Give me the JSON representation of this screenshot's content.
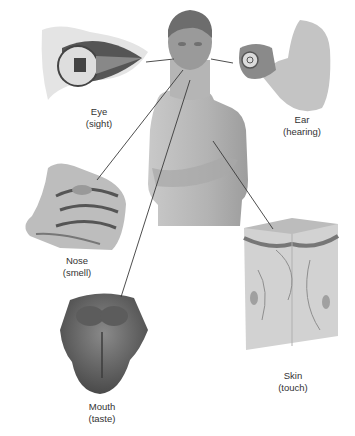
{
  "diagram": {
    "center": {
      "name": "Human torso",
      "description": "Man with arms folded"
    },
    "senses": [
      {
        "organ": "Eye",
        "sense": "(sight)"
      },
      {
        "organ": "Ear",
        "sense": "(hearing)"
      },
      {
        "organ": "Nose",
        "sense": "(smell)"
      },
      {
        "organ": "Mouth",
        "sense": "(taste)"
      },
      {
        "organ": "Skin",
        "sense": "(touch)"
      }
    ],
    "colors": {
      "background": "#ffffff",
      "line": "#3a3a3a",
      "text": "#333333",
      "illustration": "#9a9a9a"
    }
  }
}
